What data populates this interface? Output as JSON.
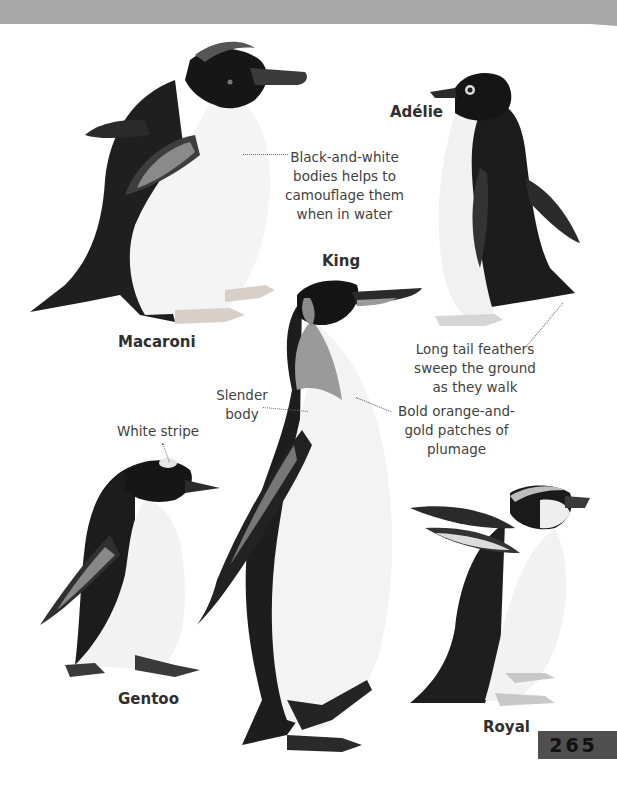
{
  "page": {
    "page_number": "265"
  },
  "species": [
    {
      "name": "Macaroni"
    },
    {
      "name": "Adélie"
    },
    {
      "name": "King"
    },
    {
      "name": "Gentoo"
    },
    {
      "name": "Royal"
    }
  ],
  "annotations": {
    "camouflage": [
      "Black-and-white",
      "bodies helps to",
      "camouflage them",
      "when in water"
    ],
    "tail_feathers": [
      "Long tail feathers",
      "sweep the ground",
      "as they walk"
    ],
    "slender": [
      "Slender",
      "body"
    ],
    "plumage": [
      "Bold orange-and-",
      "gold patches of",
      "plumage"
    ],
    "white_stripe": [
      "White stripe"
    ]
  },
  "colors": {
    "header_band": "#a9a9a9",
    "page_number_box": "#4f4f4f",
    "feather_dark": "#1e1e1e",
    "belly": "#f2f2f2"
  }
}
